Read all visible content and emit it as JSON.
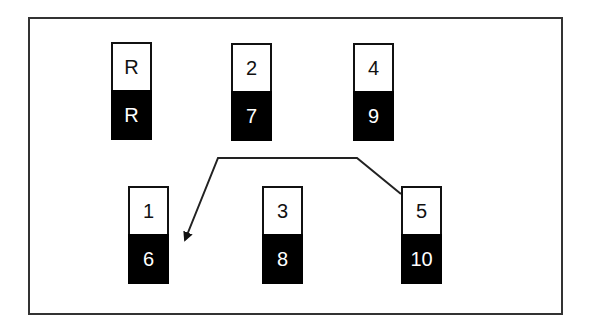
{
  "nodes": [
    {
      "id": "R",
      "top": "R",
      "bottom": "R",
      "x": 111,
      "y": 42
    },
    {
      "id": "2",
      "top": "2",
      "bottom": "7",
      "x": 231,
      "y": 43
    },
    {
      "id": "4",
      "top": "4",
      "bottom": "9",
      "x": 353,
      "y": 43
    },
    {
      "id": "1",
      "top": "1",
      "bottom": "6",
      "x": 128,
      "y": 186
    },
    {
      "id": "3",
      "top": "3",
      "bottom": "8",
      "x": 262,
      "y": 186
    },
    {
      "id": "5",
      "top": "5",
      "bottom": "10",
      "x": 401,
      "y": 186
    }
  ],
  "edges": [
    {
      "from": "5",
      "to": "1",
      "points": "401,194 357,158 218,158 185,240"
    }
  ]
}
